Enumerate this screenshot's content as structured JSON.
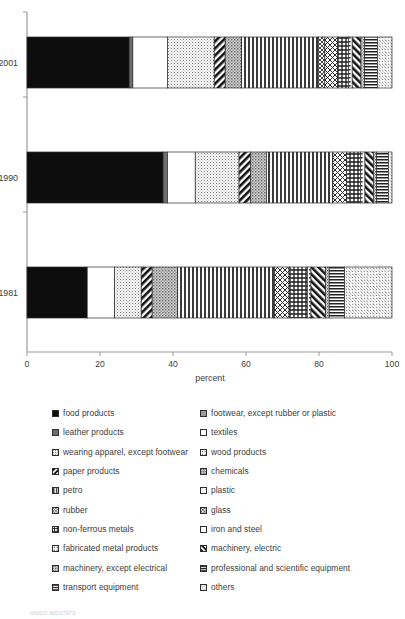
{
  "chart_data": {
    "type": "bar",
    "orientation": "horizontal",
    "stacked": true,
    "normalized": true,
    "title": "",
    "xlabel": "percent",
    "ylabel": "",
    "xlim": [
      0,
      100
    ],
    "xticks": [
      0,
      20,
      40,
      60,
      80,
      100
    ],
    "xtick_labels": [
      "0",
      "20",
      "40",
      "60",
      "80",
      "100"
    ],
    "grid": false,
    "legend_position": "below",
    "categories": [
      "2001",
      "1990",
      "1981"
    ],
    "series": [
      {
        "name": "food products",
        "key": "food",
        "values": [
          28.0,
          37.3,
          16.5
        ]
      },
      {
        "name": "leather products",
        "key": "leather",
        "values": [
          1.0,
          1.2,
          0.0
        ]
      },
      {
        "name": "footwear, except rubber or plastic",
        "key": "footwear",
        "values": [
          0.0,
          0.0,
          0.0
        ]
      },
      {
        "name": "textiles",
        "key": "textiles",
        "values": [
          9.5,
          7.6,
          7.5
        ]
      },
      {
        "name": "wearing apparel, except footwear",
        "key": "apparel",
        "values": [
          12.8,
          12.0,
          7.3
        ]
      },
      {
        "name": "wood products",
        "key": "wood",
        "values": [
          0.0,
          0.0,
          0.0
        ]
      },
      {
        "name": "paper products",
        "key": "paper",
        "values": [
          3.0,
          3.2,
          3.0
        ]
      },
      {
        "name": "chemicals",
        "key": "chemicals",
        "values": [
          4.5,
          4.3,
          7.0
        ]
      },
      {
        "name": "petro",
        "key": "petro",
        "values": [
          21.0,
          18.2,
          26.5
        ]
      },
      {
        "name": "plastic",
        "key": "plastic",
        "values": [
          0.0,
          0.0,
          0.0
        ]
      },
      {
        "name": "rubber",
        "key": "rubber",
        "values": [
          1.8,
          0.0,
          0.0
        ]
      },
      {
        "name": "glass",
        "key": "glass",
        "values": [
          3.5,
          3.8,
          4.0
        ]
      },
      {
        "name": "non-ferrous metals",
        "key": "nonferrous",
        "values": [
          3.0,
          3.8,
          5.0
        ]
      },
      {
        "name": "iron and steel",
        "key": "ironsteel",
        "values": [
          0.0,
          0.0,
          0.0
        ]
      },
      {
        "name": "fabricated metal products",
        "key": "fabmetal",
        "values": [
          1.0,
          1.2,
          1.0
        ]
      },
      {
        "name": "machinery, electric",
        "key": "machelec",
        "values": [
          2.4,
          2.4,
          4.0
        ]
      },
      {
        "name": "machinery, except electrical",
        "key": "machexcept",
        "values": [
          1.0,
          0.8,
          1.0
        ]
      },
      {
        "name": "professional and scientific equipment",
        "key": "profsci",
        "values": [
          3.5,
          3.2,
          4.2
        ]
      },
      {
        "name": "transport equipment",
        "key": "transport",
        "values": [
          0.0,
          0.0,
          0.0
        ]
      },
      {
        "name": "others",
        "key": "others",
        "values": [
          4.0,
          1.0,
          13.0
        ]
      }
    ]
  },
  "axis": {
    "x_title": "percent",
    "x_tick_labels": [
      "0",
      "20",
      "40",
      "60",
      "80",
      "100"
    ],
    "y_tick_labels": [
      "2001",
      "1990",
      "1981"
    ]
  },
  "legend": {
    "left_column": [
      {
        "label": "food products",
        "key": "food"
      },
      {
        "label": "leather products",
        "key": "leather"
      },
      {
        "label": "wearing apparel, except footwear",
        "key": "apparel"
      },
      {
        "label": "paper products",
        "key": "paper"
      },
      {
        "label": "petro",
        "key": "petro"
      },
      {
        "label": "rubber",
        "key": "rubber"
      },
      {
        "label": "non-ferrous metals",
        "key": "nonferrous"
      },
      {
        "label": "fabricated metal products",
        "key": "fabmetal"
      },
      {
        "label": "machinery, except electrical",
        "key": "machexcept"
      },
      {
        "label": "transport equipment",
        "key": "transport"
      }
    ],
    "right_column": [
      {
        "label": "footwear, except rubber or plastic",
        "key": "footwear"
      },
      {
        "label": "textiles",
        "key": "textiles"
      },
      {
        "label": "wood products",
        "key": "wood"
      },
      {
        "label": "chemicals",
        "key": "chemicals"
      },
      {
        "label": "plastic",
        "key": "plastic"
      },
      {
        "label": "glass",
        "key": "glass"
      },
      {
        "label": "iron and steel",
        "key": "ironsteel"
      },
      {
        "label": "machinery, electric",
        "key": "machelec"
      },
      {
        "label": "professional and scientific equipment",
        "key": "profsci"
      },
      {
        "label": "others",
        "key": "others"
      }
    ]
  },
  "footnote": "UNIDO INDSTAT3",
  "colors": {
    "ink": "#3c3c3c",
    "axis": "#8a8a8a",
    "black_fill": "#0d0d0d",
    "gray_fill": "#6e6e6e",
    "white_fill": "#ffffff"
  }
}
